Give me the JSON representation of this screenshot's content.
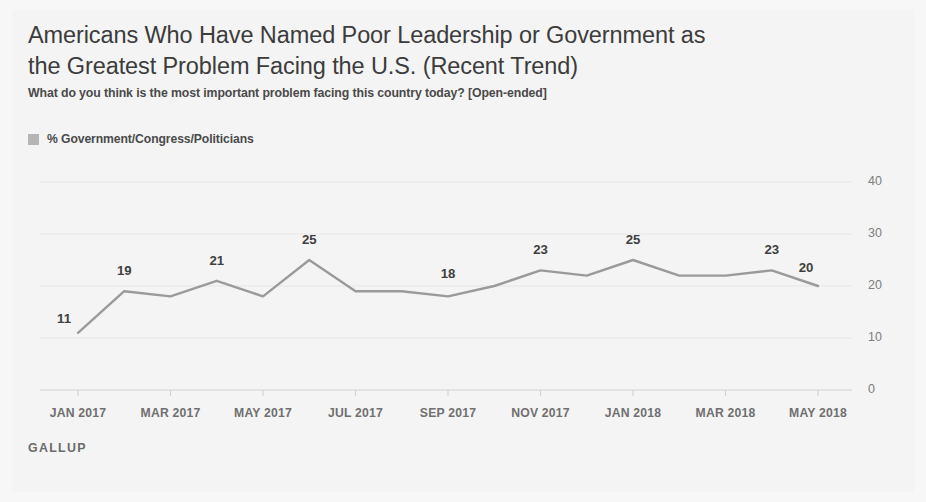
{
  "header": {
    "title": "Americans Who Have Named Poor Leadership or Government as the Greatest Problem Facing the U.S. (Recent Trend)",
    "subtitle": "What do you think is the most important problem facing this country today? [Open-ended]"
  },
  "legend": {
    "swatch_icon": "legend-swatch-icon",
    "label": "% Government/Congress/Politicians",
    "color": "#b5b5b5"
  },
  "footer": {
    "brand": "GALLUP"
  },
  "colors": {
    "line": "#9a9a9a",
    "grid": "#e6e6e6",
    "axis": "#d2d2d2",
    "background": "#f4f4f4",
    "text": "#3f3f3f"
  },
  "chart_data": {
    "type": "line",
    "title": "Americans Who Have Named Poor Leadership or Government as the Greatest Problem Facing the U.S. (Recent Trend)",
    "subtitle": "What do you think is the most important problem facing this country today? [Open-ended]",
    "xlabel": "",
    "ylabel": "",
    "ylim": [
      0,
      40
    ],
    "yticks": [
      0,
      10,
      20,
      30,
      40
    ],
    "ytick_labels": [
      "0",
      "10",
      "20",
      "30",
      "40"
    ],
    "grid": true,
    "legend_position": "top-left",
    "axis_side": "right",
    "x": [
      "JAN 2017",
      "FEB 2017",
      "MAR 2017",
      "APR 2017",
      "MAY 2017",
      "JUN 2017",
      "JUL 2017",
      "AUG 2017",
      "SEP 2017",
      "OCT 2017",
      "NOV 2017",
      "DEC 2017",
      "JAN 2018",
      "FEB 2018",
      "MAR 2018",
      "APR 2018",
      "MAY 2018"
    ],
    "xtick_labels": [
      "JAN 2017",
      "MAR 2017",
      "MAY 2017",
      "JUL 2017",
      "SEP 2017",
      "NOV 2017",
      "JAN 2018",
      "MAR 2018",
      "MAY 2018"
    ],
    "series": [
      {
        "name": "% Government/Congress/Politicians",
        "color": "#9a9a9a",
        "values": [
          11,
          19,
          18,
          21,
          18,
          25,
          19,
          19,
          18,
          20,
          23,
          22,
          25,
          22,
          22,
          23,
          20
        ]
      }
    ],
    "point_labels": [
      {
        "index": 0,
        "value": 11,
        "text": "11"
      },
      {
        "index": 1,
        "value": 19,
        "text": "19"
      },
      {
        "index": 3,
        "value": 21,
        "text": "21"
      },
      {
        "index": 5,
        "value": 25,
        "text": "25"
      },
      {
        "index": 8,
        "value": 18,
        "text": "18"
      },
      {
        "index": 10,
        "value": 23,
        "text": "23"
      },
      {
        "index": 12,
        "value": 25,
        "text": "25"
      },
      {
        "index": 15,
        "value": 23,
        "text": "23"
      },
      {
        "index": 16,
        "value": 20,
        "text": "20"
      }
    ]
  }
}
